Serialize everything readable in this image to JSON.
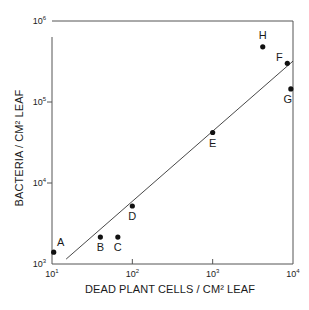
{
  "chart_data": {
    "type": "scatter",
    "title": "",
    "xlabel": "DEAD PLANT CELLS / CM² LEAF",
    "ylabel": "BACTERIA / CM² LEAF",
    "xscale": "log",
    "yscale": "log",
    "xlim": [
      10,
      10000
    ],
    "ylim": [
      1000,
      1000000
    ],
    "x_ticks": [
      {
        "base": "10",
        "exp": "1",
        "value": 10
      },
      {
        "base": "10",
        "exp": "2",
        "value": 100
      },
      {
        "base": "10",
        "exp": "3",
        "value": 1000
      },
      {
        "base": "10",
        "exp": "4",
        "value": 10000
      }
    ],
    "y_ticks": [
      {
        "base": "10",
        "exp": "3",
        "value": 1000
      },
      {
        "base": "10",
        "exp": "4",
        "value": 10000
      },
      {
        "base": "10",
        "exp": "5",
        "value": 100000
      },
      {
        "base": "10",
        "exp": "6",
        "value": 1000000
      }
    ],
    "grid": false,
    "legend": null,
    "points": [
      {
        "label": "A",
        "x": 10.5,
        "y": 1400,
        "label_pos": "above-right"
      },
      {
        "label": "B",
        "x": 40,
        "y": 2150,
        "label_pos": "below"
      },
      {
        "label": "C",
        "x": 66,
        "y": 2150,
        "label_pos": "below"
      },
      {
        "label": "D",
        "x": 100,
        "y": 5200,
        "label_pos": "below"
      },
      {
        "label": "E",
        "x": 1000,
        "y": 42000,
        "label_pos": "below"
      },
      {
        "label": "F",
        "x": 8500,
        "y": 300000,
        "label_pos": "left"
      },
      {
        "label": "G",
        "x": 9400,
        "y": 145000,
        "label_pos": "below-left"
      },
      {
        "label": "H",
        "x": 4200,
        "y": 480000,
        "label_pos": "above"
      }
    ],
    "regression_line": {
      "x": [
        15,
        10000
      ],
      "y": [
        1150,
        320000
      ]
    }
  }
}
